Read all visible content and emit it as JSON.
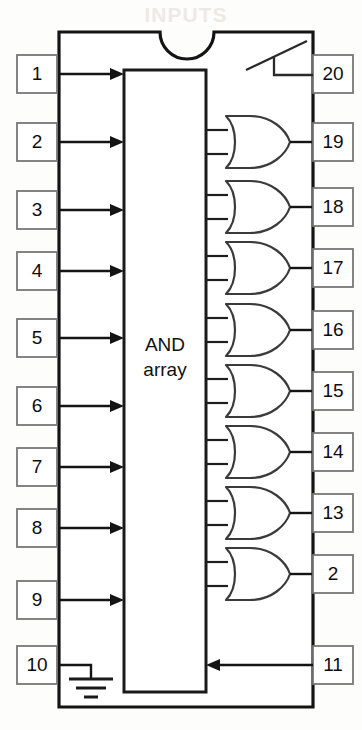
{
  "figure": {
    "array_label_line1": "AND",
    "array_label_line2": "array",
    "watermark_text": "INPUTS"
  },
  "colors": {
    "ink": "#141414",
    "gate_stroke": "#3a3a3a",
    "pin_box_stroke": "#777777",
    "paper": "#fdfdfc",
    "white": "#ffffff"
  },
  "input_pins": [
    {
      "number": "1",
      "y": 74,
      "type": "arrow-in"
    },
    {
      "number": "2",
      "y": 142,
      "type": "arrow-in"
    },
    {
      "number": "3",
      "y": 210,
      "type": "arrow-in"
    },
    {
      "number": "4",
      "y": 271,
      "type": "arrow-in"
    },
    {
      "number": "5",
      "y": 338,
      "type": "arrow-in"
    },
    {
      "number": "6",
      "y": 406,
      "type": "arrow-in"
    },
    {
      "number": "7",
      "y": 467,
      "type": "arrow-in"
    },
    {
      "number": "8",
      "y": 528,
      "type": "arrow-in"
    },
    {
      "number": "9",
      "y": 600,
      "type": "arrow-in"
    },
    {
      "number": "10",
      "y": 665,
      "type": "ground"
    }
  ],
  "output_pins": [
    {
      "number": "20",
      "y": 74,
      "type": "enable-symbol"
    },
    {
      "number": "19",
      "y": 142,
      "type": "or-gate"
    },
    {
      "number": "18",
      "y": 207,
      "type": "or-gate"
    },
    {
      "number": "17",
      "y": 268,
      "type": "or-gate"
    },
    {
      "number": "16",
      "y": 330,
      "type": "or-gate"
    },
    {
      "number": "15",
      "y": 391,
      "type": "or-gate"
    },
    {
      "number": "14",
      "y": 452,
      "type": "or-gate"
    },
    {
      "number": "13",
      "y": 513,
      "type": "or-gate"
    },
    {
      "number": "2",
      "y": 574,
      "type": "or-gate"
    },
    {
      "number": "11",
      "y": 665,
      "type": "arrow-in-left"
    }
  ]
}
